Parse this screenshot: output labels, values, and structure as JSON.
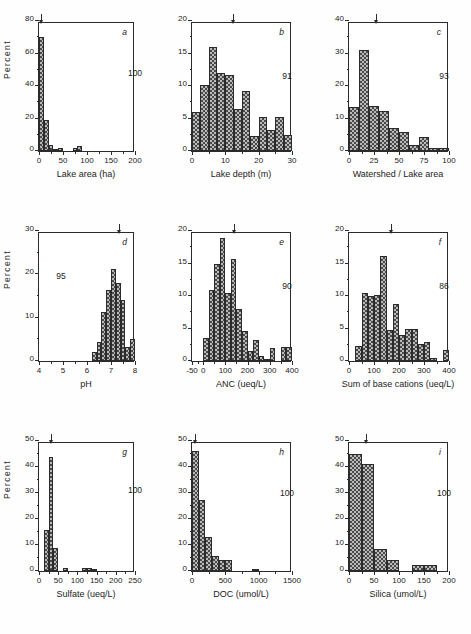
{
  "figure": {
    "ylabel": "Percent",
    "panels_count": 9
  },
  "chart_data": [
    {
      "type": "bar",
      "panel": "a",
      "title": "",
      "xlabel": "Lake area (ha)",
      "ylabel": "Percent",
      "n_label": "100",
      "xlim": [
        0,
        200
      ],
      "ylim": [
        0,
        80
      ],
      "xticks": [
        0,
        50,
        100,
        150,
        200
      ],
      "yticks": [
        0,
        20,
        40,
        60,
        80
      ],
      "bin_width": 10,
      "bin_starts": [
        0,
        10,
        20,
        30,
        40,
        50,
        60,
        70,
        80,
        90
      ],
      "values": [
        70,
        19,
        4,
        1,
        2,
        0,
        0,
        2,
        3,
        0
      ],
      "arrow_x": 5,
      "grid": false,
      "legend": "none"
    },
    {
      "type": "bar",
      "panel": "b",
      "title": "",
      "xlabel": "Lake depth (m)",
      "ylabel": "Percent",
      "n_label": "91",
      "xlim": [
        0,
        30
      ],
      "ylim": [
        0,
        20
      ],
      "xticks": [
        0,
        10,
        20,
        30
      ],
      "yticks": [
        0,
        5,
        10,
        15,
        20
      ],
      "bin_width": 2.5,
      "bin_starts": [
        0,
        2.5,
        5,
        7.5,
        10,
        12.5,
        15,
        17.5,
        20,
        22.5,
        25,
        27.5
      ],
      "values": [
        6,
        10.2,
        16,
        12,
        11.7,
        6.5,
        9.3,
        2.3,
        5.2,
        3.3,
        5.3,
        2.5
      ],
      "arrow_x": 12.2,
      "grid": false,
      "legend": "none"
    },
    {
      "type": "bar",
      "panel": "c",
      "title": "",
      "xlabel": "Watershed / Lake area",
      "ylabel": "Percent",
      "n_label": "93",
      "xlim": [
        0,
        100
      ],
      "ylim": [
        0,
        40
      ],
      "xticks": [
        0,
        25,
        50,
        75,
        100
      ],
      "yticks": [
        0,
        10,
        20,
        30,
        40
      ],
      "bin_width": 10,
      "bin_starts": [
        0,
        10,
        20,
        30,
        40,
        50,
        60,
        70,
        80,
        90
      ],
      "values": [
        13.5,
        31,
        14,
        12.3,
        7,
        6,
        2,
        4.3,
        1,
        1
      ],
      "arrow_x": 27,
      "grid": false,
      "legend": "none"
    },
    {
      "type": "bar",
      "panel": "d",
      "title": "",
      "xlabel": "pH",
      "ylabel": "Percent",
      "n_label": "95",
      "xlim": [
        4,
        8
      ],
      "ylim": [
        0,
        30
      ],
      "xticks": [
        4,
        5,
        6,
        7,
        8
      ],
      "yticks": [
        0,
        10,
        20,
        30
      ],
      "bin_width": 0.2,
      "bin_starts": [
        6.2,
        6.4,
        6.6,
        6.8,
        7.0,
        7.2,
        7.4,
        7.6,
        7.8
      ],
      "values": [
        2,
        4.3,
        11.3,
        16.3,
        21.3,
        18,
        14,
        3.3,
        5
      ],
      "arrow_x": 7.32,
      "grid": false,
      "legend": "none"
    },
    {
      "type": "bar",
      "panel": "e",
      "title": "",
      "xlabel": "ANC (ueq/L)",
      "ylabel": "Percent",
      "n_label": "90",
      "xlim": [
        -50,
        400
      ],
      "ylim": [
        0,
        20
      ],
      "xticks": [
        -50,
        0,
        100,
        200,
        300,
        400
      ],
      "yticks": [
        0,
        5,
        10,
        15,
        20
      ],
      "bin_width": 25,
      "bin_starts": [
        0,
        25,
        50,
        75,
        100,
        125,
        150,
        175,
        200,
        225,
        250,
        275,
        300,
        325,
        350,
        375
      ],
      "values": [
        3.5,
        11,
        15,
        19,
        10.5,
        15.7,
        8,
        4.6,
        1.5,
        3.2,
        0.8,
        0.3,
        2,
        0,
        2.2,
        2.2
      ],
      "arrow_x": 140,
      "grid": false,
      "legend": "none"
    },
    {
      "type": "bar",
      "panel": "f",
      "title": "",
      "xlabel": "Sum of base cations (ueq/L)",
      "ylabel": "Percent",
      "n_label": "86",
      "xlim": [
        0,
        400
      ],
      "ylim": [
        0,
        20
      ],
      "xticks": [
        0,
        100,
        200,
        300,
        400
      ],
      "yticks": [
        0,
        5,
        10,
        15,
        20
      ],
      "bin_width": 25,
      "bin_starts": [
        25,
        50,
        75,
        100,
        125,
        150,
        175,
        200,
        225,
        250,
        275,
        300,
        325,
        350,
        375
      ],
      "values": [
        2.3,
        10.5,
        10,
        10.2,
        16.2,
        4.8,
        8.8,
        4,
        5,
        5,
        2.6,
        3,
        0.5,
        0,
        1.7
      ],
      "arrow_x": 168,
      "grid": false,
      "legend": "none"
    },
    {
      "type": "bar",
      "panel": "g",
      "title": "",
      "xlabel": "Sulfate (ueq/L)",
      "ylabel": "Percent",
      "n_label": "100",
      "xlim": [
        0,
        250
      ],
      "ylim": [
        0,
        50
      ],
      "xticks": [
        0,
        50,
        100,
        150,
        200,
        250
      ],
      "yticks": [
        0,
        10,
        20,
        30,
        40,
        50
      ],
      "bin_width": 12.5,
      "bin_starts": [
        12.5,
        25,
        37.5,
        50,
        62.5,
        75,
        87.5,
        100,
        112.5,
        125,
        137.5
      ],
      "values": [
        15.8,
        44,
        8.8,
        0,
        1.2,
        0,
        0,
        0,
        1.3,
        1.3,
        0.5
      ],
      "arrow_x": 31,
      "grid": false,
      "legend": "none"
    },
    {
      "type": "bar",
      "panel": "h",
      "title": "",
      "xlabel": "DOC (umol/L)",
      "ylabel": "Percent",
      "n_label": "100",
      "xlim": [
        0,
        1500
      ],
      "ylim": [
        0,
        50
      ],
      "xticks": [
        0,
        500,
        1000,
        1500
      ],
      "yticks": [
        0,
        10,
        20,
        30,
        40,
        50
      ],
      "bin_width": 100,
      "bin_starts": [
        0,
        100,
        200,
        300,
        400,
        500,
        600,
        700,
        800,
        900
      ],
      "values": [
        46,
        27.5,
        13,
        5.8,
        4.3,
        4.2,
        0,
        0,
        0,
        0.5
      ],
      "arrow_x": 40,
      "grid": false,
      "legend": "none"
    },
    {
      "type": "bar",
      "panel": "i",
      "title": "",
      "xlabel": "Silica (umol/L)",
      "ylabel": "Percent",
      "n_label": "100",
      "xlim": [
        0,
        200
      ],
      "ylim": [
        0,
        50
      ],
      "xticks": [
        0,
        50,
        100,
        150,
        200
      ],
      "yticks": [
        0,
        10,
        20,
        30,
        40,
        50
      ],
      "bin_width": 25,
      "bin_starts": [
        0,
        25,
        50,
        75,
        100,
        125,
        150
      ],
      "values": [
        45,
        41,
        8.5,
        4.2,
        0,
        2.2,
        2.2
      ],
      "arrow_x": 33,
      "grid": false,
      "legend": "none"
    }
  ]
}
